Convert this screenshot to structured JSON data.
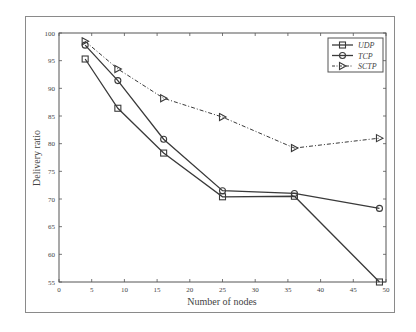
{
  "chart_data": {
    "type": "line",
    "title": "",
    "xlabel": "Number of nodes",
    "ylabel": "Delivery ratio",
    "xlim": [
      0,
      50
    ],
    "ylim": [
      55,
      100
    ],
    "xticks": [
      0,
      5,
      10,
      15,
      20,
      25,
      30,
      35,
      40,
      45,
      50
    ],
    "yticks": [
      55,
      60,
      65,
      70,
      75,
      80,
      85,
      90,
      95,
      100
    ],
    "grid": false,
    "legend_position": "top-right",
    "x": [
      4,
      9,
      16,
      25,
      36,
      49
    ],
    "series": [
      {
        "name": "UDP",
        "marker": "square",
        "linestyle": "solid",
        "values": [
          95.3,
          86.4,
          78.3,
          70.4,
          70.5,
          55.0
        ]
      },
      {
        "name": "TCP",
        "marker": "circle",
        "linestyle": "solid",
        "values": [
          97.8,
          91.4,
          80.8,
          71.5,
          71.0,
          68.3
        ]
      },
      {
        "name": "SCTP",
        "marker": "triangle-right",
        "linestyle": "dash-dot",
        "values": [
          98.5,
          93.5,
          88.2,
          84.8,
          79.2,
          81.0
        ]
      }
    ]
  },
  "colors": {
    "line": "#3a3a3a",
    "axis": "#555555",
    "frame": "#8a8a8a"
  }
}
